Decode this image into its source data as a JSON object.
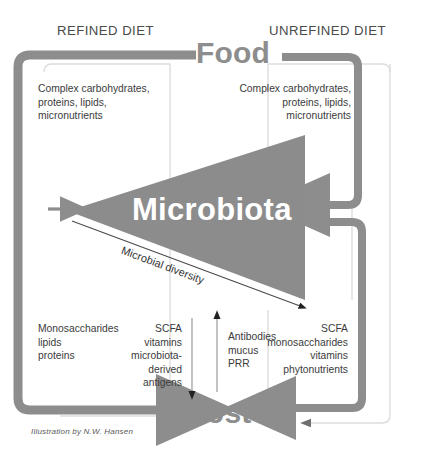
{
  "diagram": {
    "title_top": "Food",
    "title_bottom": "Host",
    "center_label": "Microbiota",
    "diagonal_label": "Microbial diversity",
    "credit": "Illustration by N.W. Hansen",
    "colors": {
      "gray_arrow": "#8d8d8d",
      "triangle_fill": "#8c8c8c",
      "thin_line": "#d8d8d8",
      "text": "#3a3a3a",
      "white_text": "#ffffff"
    },
    "columns": {
      "left_header": "REFINED DIET",
      "right_header": "UNREFINED DIET"
    },
    "blocks": {
      "left_top": {
        "lines": [
          "Complex carbohydrates,",
          "proteins, lipids,",
          "micronutrients"
        ],
        "align": "left"
      },
      "right_top": {
        "lines": [
          "Complex carbohydrates,",
          "proteins, lipids,",
          "micronutrients"
        ],
        "align": "right"
      },
      "left_bottom": {
        "lines": [
          "Monosaccharides",
          "lipids",
          "proteins"
        ],
        "align": "left"
      },
      "center_left_bottom": {
        "lines": [
          "SCFA",
          "vitamins",
          "microbiota-",
          "derived",
          "antigens"
        ],
        "align": "right"
      },
      "center_right_bottom": {
        "lines": [
          "Antibodies",
          "mucus",
          "PRR"
        ],
        "align": "left"
      },
      "right_bottom": {
        "lines": [
          "SCFA",
          "monosaccharides",
          "vitamins",
          "phytonutrients"
        ],
        "align": "right"
      }
    }
  }
}
